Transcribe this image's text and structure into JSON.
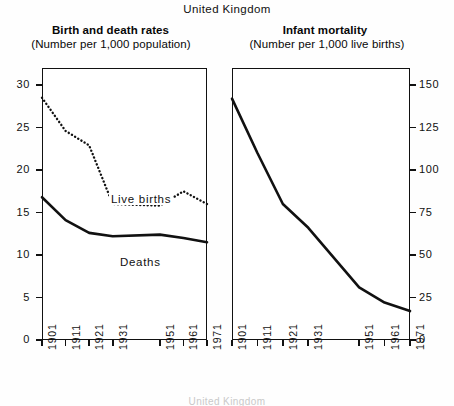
{
  "header": {
    "main_title": "United Kingdom"
  },
  "panels": [
    {
      "id": "birth-death-rates",
      "title": "Birth and death rates",
      "subtitle": "(Number per 1,000 population)",
      "y_ticks": [
        "0",
        "5",
        "10",
        "15",
        "20",
        "25",
        "30"
      ],
      "series_labels": {
        "births": "Live births",
        "deaths": "Deaths"
      }
    },
    {
      "id": "infant-mortality",
      "title": "Infant mortality",
      "subtitle": "(Number per 1,000 live births)",
      "y_ticks": [
        "0",
        "25",
        "50",
        "75",
        "100",
        "125",
        "150"
      ]
    }
  ],
  "x_ticks": [
    "1901",
    "1911",
    "1921",
    "1931",
    "1951",
    "1961",
    "1971"
  ],
  "footnote": "United Kingdom",
  "colors": {
    "ink": "#111111",
    "paper": "#ffffff",
    "page": "#fefefe"
  },
  "chart_data": [
    {
      "type": "line",
      "title": "Birth and death rates",
      "subtitle": "(Number per 1,000 population)",
      "xlabel": "",
      "ylabel": "Number per 1,000 population",
      "x": [
        1901,
        1911,
        1921,
        1931,
        1951,
        1961,
        1971
      ],
      "xtick_labels": [
        "1901",
        "1911",
        "1921",
        "1931",
        "1951",
        "1961",
        "1971"
      ],
      "ylim": [
        0,
        32
      ],
      "ytick_values": [
        0,
        5,
        10,
        15,
        20,
        25,
        30
      ],
      "grid": false,
      "legend": "inline-annotation",
      "series": [
        {
          "name": "Live births",
          "style": "dotted",
          "values": [
            28.5,
            24.6,
            22.9,
            16.0,
            15.8,
            17.5,
            16.0
          ]
        },
        {
          "name": "Deaths",
          "style": "solid",
          "values": [
            16.8,
            14.1,
            12.6,
            12.2,
            12.4,
            12.0,
            11.5
          ]
        }
      ]
    },
    {
      "type": "line",
      "title": "Infant mortality",
      "subtitle": "(Number per 1,000 live births)",
      "xlabel": "",
      "ylabel": "Number per 1,000 live births",
      "x": [
        1901,
        1911,
        1921,
        1931,
        1951,
        1961,
        1971
      ],
      "xtick_labels": [
        "1901",
        "1911",
        "1921",
        "1931",
        "1951",
        "1961",
        "1971"
      ],
      "ylim": [
        0,
        160
      ],
      "ytick_values": [
        0,
        25,
        50,
        75,
        100,
        125,
        150
      ],
      "grid": false,
      "legend": "none",
      "series": [
        {
          "name": "Infant mortality",
          "style": "solid",
          "values": [
            142,
            110,
            80,
            66,
            31,
            22,
            17
          ]
        }
      ]
    }
  ]
}
